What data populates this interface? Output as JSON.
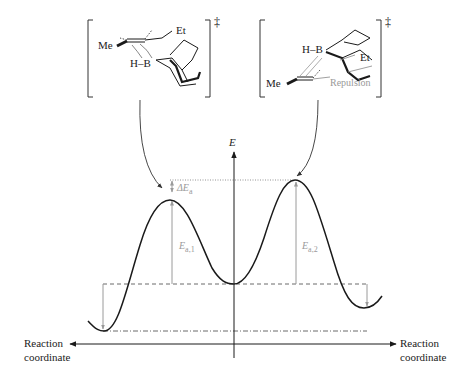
{
  "diagram": {
    "ts_left": {
      "labels": {
        "me": "Me",
        "et": "Et",
        "hb": "H–B"
      },
      "superscript": "‡"
    },
    "ts_right": {
      "labels": {
        "me": "Me",
        "et": "Et",
        "hb": "H–B",
        "repulsion": "Repulsion"
      },
      "superscript": "‡"
    },
    "axes": {
      "y_label": "E",
      "x_left_label_line1": "Reaction",
      "x_left_label_line2": "coordinate",
      "x_right_label_line1": "Reaction",
      "x_right_label_line2": "coordinate"
    },
    "annotations": {
      "delta_e": "ΔE",
      "delta_e_sub": "a",
      "ea1": "E",
      "ea1_sub": "a,1",
      "ea2": "E",
      "ea2_sub": "a,2"
    },
    "colors": {
      "curve": "#1a1a1a",
      "annotation": "#9a9a9a",
      "axis": "#1a1a1a"
    }
  }
}
